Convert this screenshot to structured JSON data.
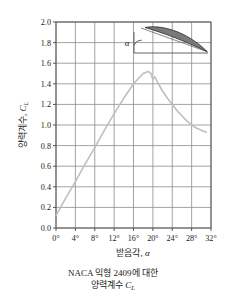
{
  "chart_data": {
    "type": "line",
    "title": "",
    "xlabel": "받음각, α",
    "ylabel": "양력계수, C_L",
    "xlim": [
      0,
      32
    ],
    "ylim": [
      0.0,
      2.0
    ],
    "grid": true,
    "legend": "none",
    "x_ticks": [
      "0°",
      "4°",
      "8°",
      "12°",
      "16°",
      "20°",
      "24°",
      "28°",
      "32°"
    ],
    "x_tick_values": [
      0,
      4,
      8,
      12,
      16,
      20,
      24,
      28,
      32
    ],
    "y_ticks": [
      "0.0",
      "0.2",
      "0.4",
      "0.6",
      "0.8",
      "1.0",
      "1.2",
      "1.4",
      "1.6",
      "1.8",
      "2.0"
    ],
    "y_tick_values": [
      0.0,
      0.2,
      0.4,
      0.6,
      0.8,
      1.0,
      1.2,
      1.4,
      1.6,
      1.8,
      2.0
    ],
    "series": [
      {
        "name": "NACA 2409 lift coefficient",
        "color": "#bfbfbf",
        "x": [
          0,
          2,
          4,
          6,
          8,
          10,
          12,
          14,
          16,
          18,
          19,
          19.6,
          20,
          20.4,
          21,
          22,
          23,
          24,
          25,
          26,
          27,
          28,
          29,
          30,
          31
        ],
        "y": [
          0.12,
          0.29,
          0.45,
          0.62,
          0.78,
          0.95,
          1.11,
          1.26,
          1.4,
          1.5,
          1.52,
          1.5,
          1.44,
          1.47,
          1.41,
          1.33,
          1.26,
          1.2,
          1.14,
          1.09,
          1.04,
          1.0,
          0.97,
          0.95,
          0.93
        ]
      }
    ],
    "annotations": [
      {
        "name": "angle-of-attack-symbol",
        "text": "α"
      },
      {
        "name": "airfoil-inset",
        "text": ""
      }
    ]
  },
  "axis": {
    "x_title_main": "받음각, ",
    "x_title_symbol": "α",
    "y_title_main": "양력계수, ",
    "y_title_symbol": "C",
    "y_title_sub": "L"
  },
  "caption": {
    "line1": "NACA 익형 2409에 대한",
    "line2_main": "양력계수 ",
    "line2_symbol": "C",
    "line2_sub": "L"
  },
  "colors": {
    "curve": "#bfbfbf",
    "grid": "#8c8c8c",
    "frame": "#555555",
    "airfoil_fill": "#7a7a7a",
    "airfoil_stroke": "#333333",
    "text": "#1a1a1a",
    "background": "#ffffff"
  }
}
